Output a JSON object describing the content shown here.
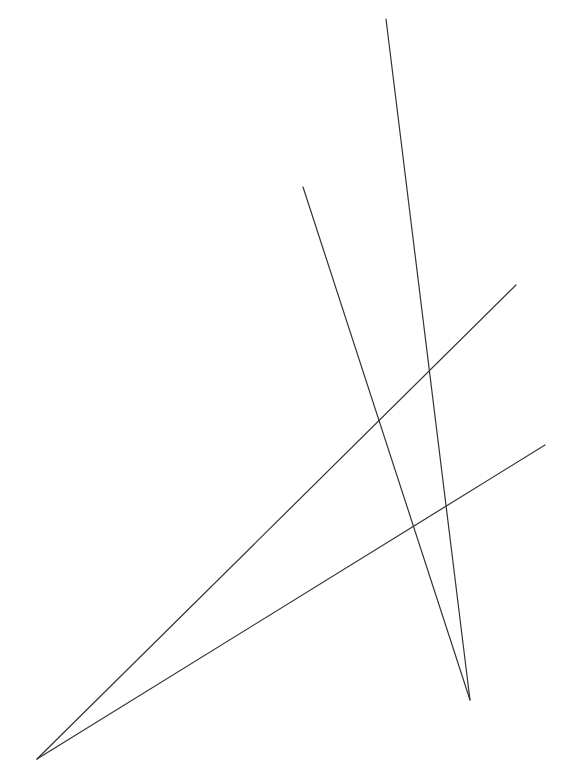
{
  "diagram": {
    "width": 564,
    "height": 779,
    "background": "#ffffff",
    "stroke": "#333333",
    "stroke_width": 1.2,
    "lines": [
      {
        "id": "line-a",
        "x1": 386,
        "y1": 19,
        "x2": 470,
        "y2": 700
      },
      {
        "id": "line-b",
        "x1": 303,
        "y1": 187,
        "x2": 470,
        "y2": 700
      },
      {
        "id": "line-c",
        "x1": 516,
        "y1": 285,
        "x2": 37,
        "y2": 759
      },
      {
        "id": "line-d",
        "x1": 545,
        "y1": 445,
        "x2": 37,
        "y2": 759
      }
    ]
  }
}
